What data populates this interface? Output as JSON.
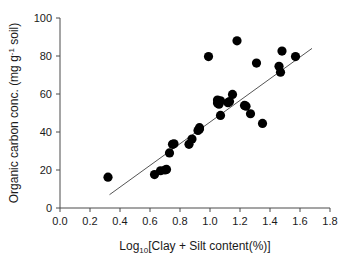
{
  "chart_data": {
    "type": "scatter",
    "title": "",
    "xlabel": "Log10[Clay + Silt content(%)]",
    "xlabel_parts": {
      "prefix": "Log",
      "sub": "10",
      "suffix": "[Clay + Silt content(%)]"
    },
    "ylabel": "Organic carbon conc. (mg g-1 soil)",
    "ylabel_parts": {
      "prefix": "Organic carbon conc.  (mg g",
      "sup": "-1",
      "suffix": " soil)"
    },
    "xlim": [
      0.0,
      1.8
    ],
    "ylim": [
      0,
      100
    ],
    "xticks": [
      0.0,
      0.2,
      0.4,
      0.6,
      0.8,
      1.0,
      1.2,
      1.4,
      1.6,
      1.8
    ],
    "xtick_labels": [
      "0.0",
      "0.2",
      "0.4",
      "0.6",
      "0.8",
      "1.0",
      "1.2",
      "1.4",
      "1.6",
      "1.8"
    ],
    "yticks": [
      0,
      20,
      40,
      60,
      80,
      100
    ],
    "ytick_labels": [
      "0",
      "20",
      "40",
      "60",
      "80",
      "100"
    ],
    "grid": false,
    "legend": false,
    "marker": "filled-circle",
    "marker_color": "#000000",
    "marker_size": 4.6,
    "points": [
      {
        "x": 0.32,
        "y": 16.2
      },
      {
        "x": 0.63,
        "y": 17.6
      },
      {
        "x": 0.67,
        "y": 19.6
      },
      {
        "x": 0.7,
        "y": 20.0
      },
      {
        "x": 0.71,
        "y": 20.3
      },
      {
        "x": 0.73,
        "y": 29.0
      },
      {
        "x": 0.75,
        "y": 33.5
      },
      {
        "x": 0.76,
        "y": 33.8
      },
      {
        "x": 0.86,
        "y": 33.5
      },
      {
        "x": 0.88,
        "y": 36.3
      },
      {
        "x": 0.92,
        "y": 40.8
      },
      {
        "x": 0.93,
        "y": 42.3
      },
      {
        "x": 0.93,
        "y": 41.6
      },
      {
        "x": 0.99,
        "y": 79.7
      },
      {
        "x": 1.05,
        "y": 55.2
      },
      {
        "x": 1.05,
        "y": 56.8
      },
      {
        "x": 1.06,
        "y": 54.6
      },
      {
        "x": 1.07,
        "y": 56.4
      },
      {
        "x": 1.07,
        "y": 48.7
      },
      {
        "x": 1.12,
        "y": 55.4
      },
      {
        "x": 1.13,
        "y": 56.0
      },
      {
        "x": 1.15,
        "y": 59.8
      },
      {
        "x": 1.18,
        "y": 88.0
      },
      {
        "x": 1.23,
        "y": 54.0
      },
      {
        "x": 1.24,
        "y": 53.6
      },
      {
        "x": 1.27,
        "y": 49.6
      },
      {
        "x": 1.31,
        "y": 76.3
      },
      {
        "x": 1.35,
        "y": 44.5
      },
      {
        "x": 1.46,
        "y": 74.6
      },
      {
        "x": 1.47,
        "y": 71.5
      },
      {
        "x": 1.48,
        "y": 82.6
      },
      {
        "x": 1.57,
        "y": 79.7
      }
    ],
    "fit_line": {
      "x0": 0.33,
      "y0": 7.0,
      "x1": 1.68,
      "y1": 84.0,
      "color": "#555555"
    },
    "axis_color": "#4a4a4a",
    "background": "#ffffff"
  }
}
